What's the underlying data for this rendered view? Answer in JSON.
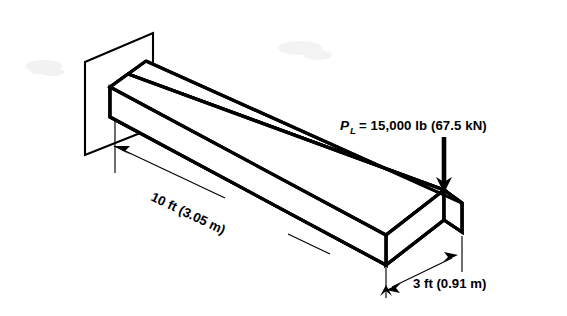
{
  "figure": {
    "kind": "cantilever-beam-isometric-diagram",
    "background_color": "#ffffff",
    "line_color": "#000000",
    "labels": {
      "load_symbol": "P",
      "load_subscript": "L",
      "load_equation": "= 15,000 lb (67.5 kN)",
      "load_full": "P_L = 15,000 lb (67.5 kN)",
      "length_dimension": "10 ft (3.05 m)",
      "width_dimension": "3 ft (0.91 m)"
    },
    "values": {
      "load_lb": 15000,
      "load_kN": 67.5,
      "length_ft": 10,
      "length_m": 3.05,
      "width_ft": 3,
      "width_m": 0.91
    },
    "parts": {
      "wall_name": "support-wall",
      "beam_name": "cantilever-beam",
      "load_arrow_name": "point-load-arrow",
      "length_dim_name": "length-dimension",
      "width_dim_name": "width-dimension"
    }
  }
}
